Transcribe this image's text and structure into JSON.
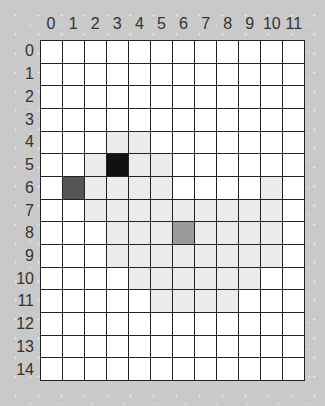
{
  "board": {
    "columns": 12,
    "rows": 15,
    "column_labels": [
      "0",
      "1",
      "2",
      "3",
      "4",
      "5",
      "6",
      "7",
      "8",
      "9",
      "10",
      "11"
    ],
    "row_labels": [
      "0",
      "1",
      "2",
      "3",
      "4",
      "5",
      "6",
      "7",
      "8",
      "9",
      "10",
      "11",
      "12",
      "13",
      "14"
    ],
    "colors": {
      "background": "#c9c9c9",
      "empty": "#ffffff",
      "light": "#ebebeb",
      "medium": "#9a9a9a",
      "dark": "#555555",
      "black": "#111111",
      "gridline": "#222222",
      "label": "#333333"
    },
    "cells": [
      {
        "row": 4,
        "col": 3,
        "state": "light"
      },
      {
        "row": 4,
        "col": 4,
        "state": "light"
      },
      {
        "row": 5,
        "col": 2,
        "state": "light"
      },
      {
        "row": 5,
        "col": 3,
        "state": "black"
      },
      {
        "row": 5,
        "col": 4,
        "state": "light"
      },
      {
        "row": 5,
        "col": 5,
        "state": "light"
      },
      {
        "row": 6,
        "col": 1,
        "state": "dark"
      },
      {
        "row": 6,
        "col": 2,
        "state": "light"
      },
      {
        "row": 6,
        "col": 3,
        "state": "light"
      },
      {
        "row": 6,
        "col": 4,
        "state": "light"
      },
      {
        "row": 6,
        "col": 5,
        "state": "light"
      },
      {
        "row": 6,
        "col": 10,
        "state": "light"
      },
      {
        "row": 7,
        "col": 2,
        "state": "light"
      },
      {
        "row": 7,
        "col": 3,
        "state": "light"
      },
      {
        "row": 7,
        "col": 4,
        "state": "light"
      },
      {
        "row": 7,
        "col": 5,
        "state": "light"
      },
      {
        "row": 7,
        "col": 6,
        "state": "light"
      },
      {
        "row": 7,
        "col": 7,
        "state": "light"
      },
      {
        "row": 7,
        "col": 8,
        "state": "light"
      },
      {
        "row": 7,
        "col": 9,
        "state": "light"
      },
      {
        "row": 7,
        "col": 10,
        "state": "light"
      },
      {
        "row": 8,
        "col": 3,
        "state": "light"
      },
      {
        "row": 8,
        "col": 4,
        "state": "light"
      },
      {
        "row": 8,
        "col": 5,
        "state": "light"
      },
      {
        "row": 8,
        "col": 6,
        "state": "medium"
      },
      {
        "row": 8,
        "col": 7,
        "state": "light"
      },
      {
        "row": 8,
        "col": 8,
        "state": "light"
      },
      {
        "row": 8,
        "col": 9,
        "state": "light"
      },
      {
        "row": 8,
        "col": 10,
        "state": "light"
      },
      {
        "row": 9,
        "col": 3,
        "state": "light"
      },
      {
        "row": 9,
        "col": 4,
        "state": "light"
      },
      {
        "row": 9,
        "col": 5,
        "state": "light"
      },
      {
        "row": 9,
        "col": 6,
        "state": "light"
      },
      {
        "row": 9,
        "col": 7,
        "state": "light"
      },
      {
        "row": 9,
        "col": 8,
        "state": "light"
      },
      {
        "row": 9,
        "col": 9,
        "state": "light"
      },
      {
        "row": 9,
        "col": 10,
        "state": "light"
      },
      {
        "row": 10,
        "col": 4,
        "state": "light"
      },
      {
        "row": 10,
        "col": 5,
        "state": "light"
      },
      {
        "row": 10,
        "col": 6,
        "state": "light"
      },
      {
        "row": 10,
        "col": 7,
        "state": "light"
      },
      {
        "row": 10,
        "col": 8,
        "state": "light"
      },
      {
        "row": 10,
        "col": 9,
        "state": "light"
      },
      {
        "row": 11,
        "col": 5,
        "state": "light"
      },
      {
        "row": 11,
        "col": 6,
        "state": "light"
      },
      {
        "row": 11,
        "col": 7,
        "state": "light"
      },
      {
        "row": 11,
        "col": 8,
        "state": "light"
      }
    ]
  }
}
